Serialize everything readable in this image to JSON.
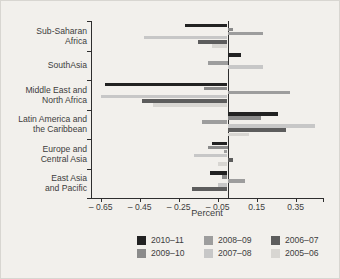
{
  "chart_data": {
    "type": "bar",
    "orientation": "horizontal",
    "xlabel": "Percent",
    "xlim": [
      -0.7,
      0.49
    ],
    "x_ticks": [
      {
        "label": "– 0.65",
        "value": -0.65
      },
      {
        "label": "– 0.45",
        "value": -0.45
      },
      {
        "label": "– 0.25",
        "value": -0.25
      },
      {
        "label": "– 0.05",
        "value": -0.05
      },
      {
        "label": "0.15",
        "value": 0.15
      },
      {
        "label": "0.35",
        "value": 0.35
      }
    ],
    "grid": false,
    "legend_position": "bottom",
    "categories": [
      "Sub-Saharan Africa",
      "SouthAsia",
      "Middle East and North Africa",
      "Latin America and the Caribbean",
      "Europe and Central Asia",
      "East Asia and Pacific"
    ],
    "category_lines": [
      [
        "Sub-Saharan",
        "Africa"
      ],
      [
        "SouthAsia"
      ],
      [
        "Middle East and",
        "North Africa"
      ],
      [
        "Latin America and",
        "the Caribbean"
      ],
      [
        "Europe and",
        "Central Asia"
      ],
      [
        "East Asia",
        "and Pacific"
      ]
    ],
    "series": [
      {
        "name": "2010–11",
        "color": "#222222",
        "values": [
          -0.22,
          0.07,
          -0.63,
          0.26,
          -0.08,
          -0.09
        ]
      },
      {
        "name": "2009–10",
        "color": "#8b8b8b",
        "values": [
          0.03,
          0.0,
          -0.12,
          0.17,
          -0.1,
          -0.03
        ]
      },
      {
        "name": "2008–09",
        "color": "#9d9d9d",
        "values": [
          0.18,
          -0.1,
          0.32,
          -0.13,
          -0.02,
          0.09
        ]
      },
      {
        "name": "2007–08",
        "color": "#c7c7c7",
        "values": [
          -0.43,
          0.18,
          -0.65,
          0.45,
          -0.17,
          -0.05
        ]
      },
      {
        "name": "2006–07",
        "color": "#5d5d5d",
        "values": [
          -0.15,
          0.0,
          -0.44,
          0.3,
          0.03,
          -0.18
        ]
      },
      {
        "name": "2005–06",
        "color": "#d8d6d2",
        "values": [
          -0.08,
          0.0,
          -0.38,
          0.11,
          -0.05,
          0.0
        ]
      }
    ],
    "legend_rows": [
      [
        "2010–11",
        "2008–09",
        "2006–07"
      ],
      [
        "2009–10",
        "2007–08",
        "2005–06"
      ]
    ]
  }
}
